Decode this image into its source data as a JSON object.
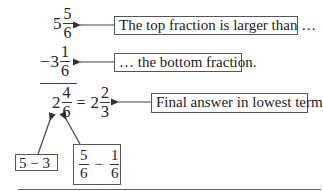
{
  "rows": [
    {
      "id": "top",
      "sign": "",
      "whole": "5",
      "numerator": "5",
      "denominator": "6",
      "callout": "The top fraction is larger than …"
    },
    {
      "id": "bottom",
      "sign": "−",
      "whole": "3",
      "numerator": "1",
      "denominator": "6",
      "callout": "… the bottom fraction."
    }
  ],
  "result": {
    "whole": "2",
    "numerator": "4",
    "denominator": "6",
    "equals": "=",
    "simplified_whole": "2",
    "simplified_numerator": "2",
    "simplified_denominator": "3",
    "callout": "Final answer in lowest terms"
  },
  "explanations": {
    "whole_part": "5 − 3",
    "fraction_part": {
      "left_numerator": "5",
      "left_denominator": "6",
      "operator": "−",
      "right_numerator": "1",
      "right_denominator": "6"
    }
  },
  "colors": {
    "text": "#222222",
    "lines": "#444444",
    "box_border": "#555555",
    "background": "#ffffff"
  }
}
